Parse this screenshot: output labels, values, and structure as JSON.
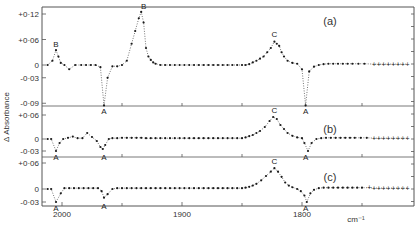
{
  "chart_data": {
    "type": "line",
    "title": "",
    "xlabel": "cm-1",
    "ylabel": "Δ Absorbance",
    "x_ticks": [
      2000,
      1900,
      1800
    ],
    "x_minor_ticks": [
      1950,
      1850,
      1750
    ],
    "xlim": [
      2017,
      1707
    ],
    "grid": false,
    "legend": null,
    "panels": [
      {
        "label": "(a)",
        "y_ticks": [
          "+0·12",
          "+0·06",
          "0",
          "-0·03",
          "-0·09"
        ],
        "y_tick_values": [
          0.12,
          0.06,
          0,
          -0.03,
          -0.09
        ],
        "peak_labels": [
          {
            "text": "B",
            "x": 2005,
            "y": 0.035
          },
          {
            "text": "A",
            "x": 1965,
            "y": -0.095
          },
          {
            "text": "B",
            "x": 1932,
            "y": 0.125
          },
          {
            "text": "C",
            "x": 1823,
            "y": 0.06
          },
          {
            "text": "A",
            "x": 1797,
            "y": -0.095
          }
        ],
        "series": [
          {
            "name": "(a)",
            "x": [
              2012,
              2008,
              2005,
              2003,
              2001,
              1998,
              1994,
              1989,
              1984,
              1980,
              1976,
              1972,
              1968,
              1965,
              1962,
              1958,
              1954,
              1950,
              1946,
              1942,
              1939,
              1936,
              1934,
              1932,
              1930,
              1928,
              1926,
              1924,
              1922,
              1918,
              1914,
              1910,
              1906,
              1902,
              1898,
              1894,
              1890,
              1886,
              1882,
              1878,
              1874,
              1870,
              1866,
              1862,
              1858,
              1854,
              1850,
              1847,
              1844,
              1841,
              1838,
              1835,
              1832,
              1829,
              1826,
              1823,
              1821,
              1819,
              1817,
              1815,
              1812,
              1808,
              1804,
              1800,
              1797,
              1794,
              1790,
              1786,
              1782,
              1778,
              1774,
              1770,
              1766,
              1762,
              1758,
              1753,
              1748,
              1740,
              1736,
              1732,
              1728,
              1724,
              1720,
              1716,
              1712
            ],
            "y": [
              0,
              0.01,
              0.035,
              0.02,
              0.005,
              0,
              -0.01,
              0,
              0,
              0,
              0,
              0,
              -0.005,
              -0.095,
              -0.03,
              -0.003,
              -0.003,
              0,
              0.01,
              0.05,
              0.08,
              0.11,
              0.125,
              0.1,
              0.04,
              0.02,
              0.012,
              0.006,
              0.003,
              0,
              0,
              0,
              0,
              0,
              0,
              0,
              0,
              0,
              0,
              0,
              0,
              0,
              0,
              0,
              0,
              0,
              0,
              0,
              0.002,
              0.006,
              0.01,
              0.015,
              0.02,
              0.03,
              0.04,
              0.055,
              0.05,
              0.045,
              0.03,
              0.02,
              0.01,
              0.005,
              0.003,
              -0.01,
              -0.095,
              -0.015,
              -0.004,
              0,
              0.002,
              0.003,
              0.003,
              0.003,
              0.003,
              0.003,
              0.003,
              0.003,
              0.003,
              0.002,
              0.002,
              0.002,
              0.002,
              0.002,
              0.002,
              0.002,
              0.002
            ]
          }
        ]
      },
      {
        "label": "(b)",
        "y_ticks": [
          "+0·06",
          "0",
          "-0·03"
        ],
        "y_tick_values": [
          0.06,
          0,
          -0.03
        ],
        "peak_labels": [
          {
            "text": "A",
            "x": 2005,
            "y": -0.03
          },
          {
            "text": "A",
            "x": 1965,
            "y": -0.03
          },
          {
            "text": "C",
            "x": 1823,
            "y": 0.058
          },
          {
            "text": "A",
            "x": 1797,
            "y": -0.03
          }
        ],
        "series": [
          {
            "name": "(b)",
            "x": [
              2012,
              2009,
              2005,
              2002,
              1999,
              1995,
              1991,
              1987,
              1983,
              1979,
              1975,
              1971,
              1968,
              1966,
              1964,
              1961,
              1958,
              1954,
              1950,
              1946,
              1942,
              1938,
              1934,
              1930,
              1926,
              1922,
              1918,
              1914,
              1910,
              1906,
              1902,
              1898,
              1894,
              1890,
              1886,
              1882,
              1878,
              1874,
              1870,
              1866,
              1862,
              1858,
              1854,
              1850,
              1847,
              1844,
              1841,
              1838,
              1835,
              1831,
              1827,
              1824,
              1821,
              1818,
              1815,
              1812,
              1808,
              1804,
              1800,
              1798,
              1795,
              1792,
              1788,
              1784,
              1780,
              1776,
              1772,
              1768,
              1764,
              1760,
              1756,
              1751,
              1746,
              1740,
              1736,
              1732,
              1728,
              1724,
              1720,
              1716,
              1712
            ],
            "y": [
              0,
              0,
              -0.03,
              -0.01,
              0,
              0.003,
              0.006,
              0.002,
              0.002,
              0.015,
              0.005,
              -0.005,
              -0.02,
              -0.025,
              -0.015,
              0,
              0.002,
              0.002,
              0.003,
              0.003,
              0.003,
              0.003,
              0.003,
              0.002,
              0.002,
              0.002,
              0.002,
              0.002,
              0.002,
              0.002,
              0.002,
              0.002,
              0.002,
              0.002,
              0.002,
              0.002,
              0.002,
              0.002,
              0.002,
              0.002,
              0.002,
              0.002,
              0.002,
              0.002,
              0.004,
              0.007,
              0.01,
              0.015,
              0.02,
              0.03,
              0.045,
              0.055,
              0.05,
              0.035,
              0.025,
              0.015,
              0.008,
              0.004,
              0.002,
              -0.01,
              -0.03,
              -0.01,
              0,
              0.002,
              0.003,
              0.003,
              0.003,
              0.003,
              0.003,
              0.003,
              0.003,
              0.003,
              0.003,
              0.002,
              0.002,
              0.002,
              0.002,
              0.002,
              0.002,
              0.002,
              0.002
            ]
          }
        ]
      },
      {
        "label": "(c)",
        "y_ticks": [
          "+0·06",
          "0",
          "-0·03"
        ],
        "y_tick_values": [
          0.06,
          0,
          -0.03
        ],
        "peak_labels": [
          {
            "text": "A",
            "x": 2005,
            "y": -0.03
          },
          {
            "text": "A",
            "x": 1965,
            "y": -0.025
          },
          {
            "text": "C",
            "x": 1823,
            "y": 0.05
          },
          {
            "text": "A",
            "x": 1797,
            "y": -0.03
          }
        ],
        "series": [
          {
            "name": "(c)",
            "x": [
              2012,
              2009,
              2005,
              2001,
              1998,
              1994,
              1990,
              1986,
              1982,
              1978,
              1974,
              1970,
              1967,
              1965,
              1962,
              1958,
              1954,
              1950,
              1946,
              1942,
              1938,
              1934,
              1930,
              1926,
              1922,
              1918,
              1914,
              1910,
              1906,
              1902,
              1898,
              1894,
              1890,
              1886,
              1882,
              1878,
              1874,
              1870,
              1866,
              1862,
              1858,
              1854,
              1850,
              1847,
              1844,
              1841,
              1838,
              1834,
              1830,
              1826,
              1823,
              1820,
              1817,
              1814,
              1811,
              1808,
              1804,
              1801,
              1798,
              1796,
              1793,
              1790,
              1786,
              1782,
              1778,
              1774,
              1770,
              1766,
              1762,
              1758,
              1754,
              1750,
              1744,
              1740,
              1736,
              1732,
              1728,
              1724,
              1720,
              1716,
              1712
            ],
            "y": [
              0,
              0,
              -0.03,
              -0.01,
              0.002,
              0.002,
              0.002,
              0.002,
              0.002,
              0.002,
              0.002,
              0.002,
              -0.005,
              -0.02,
              -0.012,
              0,
              0.002,
              0.002,
              0.002,
              0.002,
              0.002,
              0.002,
              0.002,
              0.002,
              0.002,
              0.002,
              0.002,
              0.002,
              0.002,
              0.002,
              0.002,
              0.002,
              0.002,
              0.002,
              0.002,
              0.002,
              0.002,
              0.002,
              0.002,
              0.002,
              0.002,
              0.002,
              0.002,
              0.003,
              0.005,
              0.008,
              0.012,
              0.02,
              0.03,
              0.04,
              0.048,
              0.04,
              0.028,
              0.015,
              0.008,
              0.004,
              0,
              -0.005,
              -0.015,
              -0.03,
              -0.01,
              -0.002,
              0.002,
              0.003,
              0.003,
              0.003,
              0.003,
              0.003,
              0.003,
              0.003,
              0.003,
              0.003,
              0.003,
              0.002,
              0.002,
              0.002,
              0.002,
              0.002,
              0.002,
              0.002,
              0.002
            ]
          }
        ]
      }
    ]
  },
  "axes": {
    "ylabel": "Δ Absorbance",
    "xlabel": "cm⁻¹",
    "x_tick_labels": [
      "2000",
      "1900",
      "1800"
    ]
  },
  "colors": {
    "ink": "#1a1a1a",
    "axis": "#555555",
    "background": "#ffffff"
  }
}
